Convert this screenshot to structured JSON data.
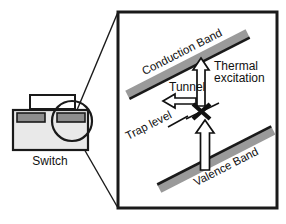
{
  "figure": {
    "type": "semiconductor-band-diagram"
  },
  "device": {
    "label": "Switch",
    "body_color": "#e9e9e9",
    "contact_color": "#8d8d8d",
    "beam_color": "#ffffff",
    "outline_color": "#1a1a1a"
  },
  "inset": {
    "border_color": "#1a1a1a",
    "background": "#ffffff",
    "callout_label": "magnifier-circle"
  },
  "bands": [
    {
      "name": "conduction-band",
      "label": "Conduction Band",
      "fill": "#9a9a9a",
      "edge": "#1a1a1a"
    },
    {
      "name": "valence-band",
      "label": "Valence Band",
      "fill": "#9a9a9a",
      "edge": "#1a1a1a"
    }
  ],
  "trap": {
    "label": "Trap level",
    "marker": "x-cross",
    "marker_color": "#111111"
  },
  "processes": [
    {
      "name": "tunnel",
      "label": "Tunnel",
      "arrow_direction": "left",
      "arrow_fill": "#ffffff",
      "arrow_stroke": "#111111"
    },
    {
      "name": "thermal-excitation",
      "label": "Thermal\nexcitation",
      "label_line_1": "Thermal",
      "label_line_2": "excitation",
      "arrow_direction": "up",
      "arrow_fill": "#ffffff",
      "arrow_stroke": "#111111"
    },
    {
      "name": "valence-to-trap",
      "label": "",
      "arrow_direction": "up",
      "arrow_fill": "#ffffff",
      "arrow_stroke": "#111111"
    }
  ]
}
